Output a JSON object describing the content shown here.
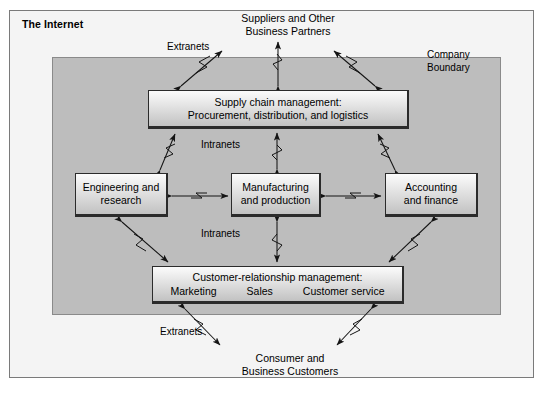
{
  "diagram": {
    "title": "The Internet",
    "company_boundary_label_line1": "Company",
    "company_boundary_label_line2": "Boundary"
  },
  "actors": {
    "top": {
      "line1": "Suppliers and Other",
      "line2": "Business Partners"
    },
    "bottom": {
      "line1": "Consumer and",
      "line2": "Business Customers"
    }
  },
  "network_labels": {
    "extranets_top": "Extranets",
    "extranets_bottom": "Extranets",
    "intranets_top": "Intranets",
    "intranets_bottom": "Intranets"
  },
  "boxes": {
    "supply_chain": {
      "line1": "Supply chain management:",
      "line2": "Procurement, distribution, and logistics"
    },
    "engineering": {
      "line1": "Engineering and",
      "line2": "research"
    },
    "manufacturing": {
      "line1": "Manufacturing",
      "line2": "and production"
    },
    "accounting": {
      "line1": "Accounting",
      "line2": "and finance"
    },
    "crm": {
      "line1": "Customer-relationship management:",
      "item1": "Marketing",
      "item2": "Sales",
      "item3": "Customer service"
    }
  },
  "colors": {
    "internet_background": "#f4f4f4",
    "company_background": "#bdbdbd",
    "box_border": "#2b2b2b",
    "arrow_stroke": "#1a1a1a",
    "frame_border": "#7a7a7a"
  }
}
